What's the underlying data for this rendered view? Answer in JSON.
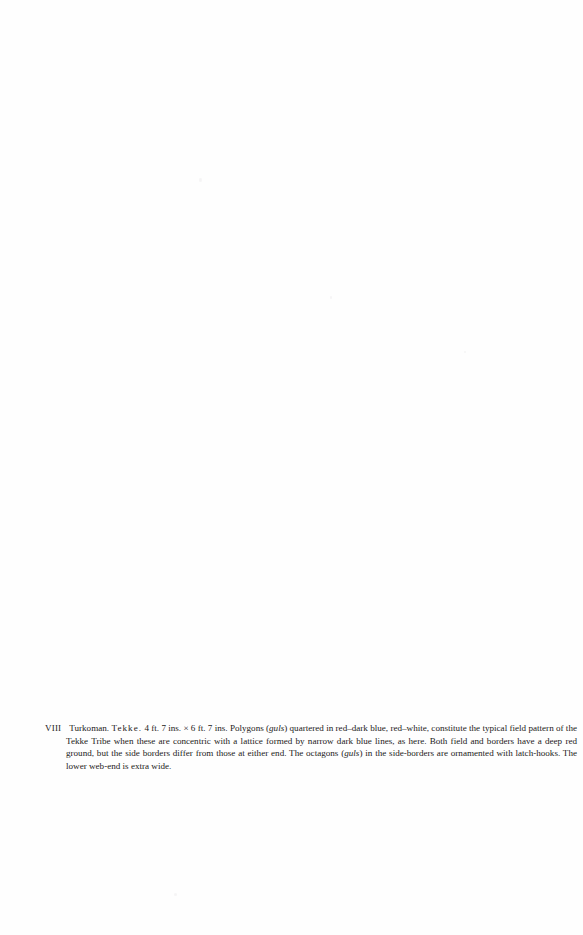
{
  "page": {
    "background_color": "#fefefe",
    "text_color": "#1c1a19",
    "width": 583,
    "height": 935
  },
  "plate_caption": {
    "number": "VIII",
    "origin": "Turkoman.",
    "tribe": "Tekke.",
    "dimensions": "4 ft. 7 ins. × 6 ft. 7 ins.",
    "term_1": "guls",
    "term_2": "guls",
    "segment_1": "Polygons (",
    "segment_2": ") quartered in red–dark blue, red–white, constitute the typical field pattern of the Tekke Tribe when these are concentric with a lattice formed by narrow dark blue lines, as here. Both field and borders have a deep red ground, but the side borders differ from those at either end. The octagons (",
    "segment_3": ") in the side-borders are ornamented with latch-hooks. The lower web-end is extra wide.",
    "full_text": "VIII Turkoman. Tekke. 4 ft. 7 ins. × 6 ft. 7 ins. Polygons (guls) quartered in red–dark blue, red–white, constitute the typical field pattern of the Tekke Tribe when these are concentric with a lattice formed by narrow dark blue lines, as here. Both field and borders have a deep red ground, but the side borders differ from those at either end. The octagons (guls) in the side-borders are ornamented with latch-hooks. The lower web-end is extra wide."
  }
}
